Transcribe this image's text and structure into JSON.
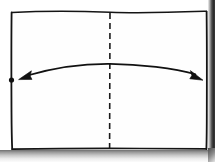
{
  "figure": {
    "title": "Hand-drawn rectangle with centerline and span arrow",
    "description": "Scanned line drawing: an open rectangle outline, a dashed vertical centerline, and a shallow upward-bowed double-headed arrow spanning from the left border to the right border.",
    "medium": "scanned ink drawing",
    "background_color": "#ffffff",
    "ink_color": "#111111",
    "shadow_color": "#6f6f6f"
  },
  "canvas": {
    "width": 215,
    "height": 162
  },
  "elements": {
    "rectangle": {
      "name": "outer rectangle",
      "left": 11.5,
      "top": 12,
      "right": 207,
      "bottom": 149,
      "stroke_color": "#141414",
      "stroke_width": 1.6,
      "style": "solid hand-drawn"
    },
    "centerline": {
      "name": "vertical dashed centerline",
      "x": 110,
      "top": 12,
      "bottom": 149,
      "stroke_color": "#1a1a1a",
      "stroke_width": 1.6,
      "style": "dashed",
      "dash_length": 6,
      "dash_gap": 4
    },
    "span_arrow": {
      "name": "double-headed curved span arrow",
      "start_x": 24,
      "start_y": 77,
      "end_x": 198,
      "end_y": 76,
      "apex_x": 110,
      "apex_y": 64,
      "curvature": "shallow upward arc",
      "stroke_color": "#111111",
      "stroke_width": 1.7,
      "arrowhead_start": "filled triangle pointing left",
      "arrowhead_end": "filled triangle pointing right"
    },
    "left_marker_dot": {
      "name": "dot marker on left border",
      "cx": 11.5,
      "cy": 80,
      "radius": 2.6,
      "fill_color": "#111111"
    }
  },
  "labels": {
    "figure_caption": "",
    "left_edge": "",
    "right_edge": "",
    "centerline": "",
    "arrow": ""
  }
}
